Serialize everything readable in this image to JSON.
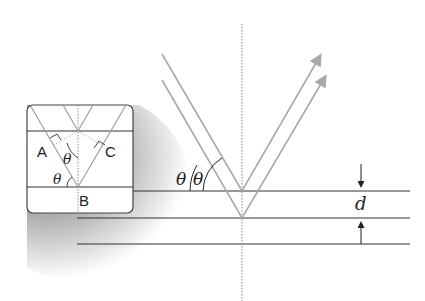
{
  "diagram": {
    "labels": {
      "theta_left": "θ",
      "theta_right": "θ",
      "spacing": "d"
    },
    "inset": {
      "point_a": "A",
      "point_b": "B",
      "point_c": "C",
      "theta_top": "θ",
      "theta_bottom": "θ"
    },
    "colors": {
      "plane_line": "#333333",
      "ray": "#a8a8a8",
      "normal": "#888888",
      "inset_border": "#444444"
    }
  }
}
